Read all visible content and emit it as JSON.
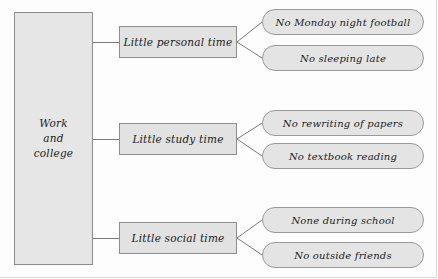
{
  "diagram": {
    "type": "tree-map",
    "root": {
      "label": "Work and college",
      "lines": [
        "Work",
        "and",
        "college"
      ]
    },
    "branches": [
      {
        "label": "Little personal time",
        "leaves": [
          "No Monday night football",
          "No sleeping late"
        ]
      },
      {
        "label": "Little study time",
        "leaves": [
          "No rewriting of papers",
          "No textbook reading"
        ]
      },
      {
        "label": "Little social time",
        "leaves": [
          "None during school",
          "No outside friends"
        ]
      }
    ],
    "colors": {
      "node_fill": "#e4e4e4",
      "node_border": "#8d8d8d",
      "connector": "#7a7a7a",
      "background": "#fdfdfd",
      "text": "#1b1b1b"
    }
  }
}
